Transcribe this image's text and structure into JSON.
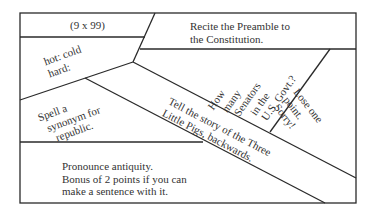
{
  "board": {
    "line_color": "#2a2a2a",
    "background": "#ffffff",
    "spaces": [
      {
        "id": "multiply",
        "lines": [
          "(9 x 99)"
        ]
      },
      {
        "id": "preamble",
        "lines": [
          "Recite the Preamble to",
          "the Constitution."
        ]
      },
      {
        "id": "analogy",
        "lines": [
          "hot: cold",
          "hard:"
        ]
      },
      {
        "id": "senators",
        "lines": [
          "How",
          "many",
          "Senators",
          "in the",
          "U.S. Govt.?"
        ]
      },
      {
        "id": "lose-point",
        "lines": [
          "Lose one",
          "point.",
          "Sorry!"
        ]
      },
      {
        "id": "synonym",
        "lines": [
          "Spell a",
          "synonym for",
          "republic."
        ]
      },
      {
        "id": "three-pigs",
        "lines": [
          "Tell the story of the Three",
          "Little Pigs, backwards."
        ]
      },
      {
        "id": "antiquity",
        "lines": [
          "Pronounce antiquity.",
          "Bonus of 2 points if you can",
          "make a sentence with it."
        ]
      }
    ]
  }
}
